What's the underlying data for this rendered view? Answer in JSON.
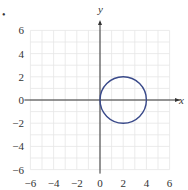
{
  "chart_data": {
    "type": "line",
    "title": "",
    "xlabel": "x",
    "ylabel": "y",
    "xlim": [
      -6,
      6
    ],
    "ylim": [
      -6,
      6
    ],
    "grid": true,
    "grid_step": 1,
    "x_ticks": [
      -6,
      -4,
      -2,
      0,
      2,
      4,
      6
    ],
    "y_ticks": [
      -6,
      -4,
      -2,
      0,
      2,
      4,
      6
    ],
    "x_tick_labels": [
      "−6",
      "−4",
      "−2",
      "0",
      "2",
      "4",
      "6"
    ],
    "y_tick_labels": [
      "−6",
      "−4",
      "−2",
      "0",
      "2",
      "4",
      "6"
    ],
    "series": [
      {
        "name": "circle",
        "shape": "circle",
        "center": [
          2,
          0
        ],
        "radius": 2,
        "equation": "(x-2)^2 + y^2 = 4",
        "color": "#3a4a8a"
      }
    ],
    "legend": null
  },
  "colors": {
    "grid": "#e6e6e6",
    "axis": "#333333",
    "curve": "#3a4a8a"
  },
  "marker": "•"
}
